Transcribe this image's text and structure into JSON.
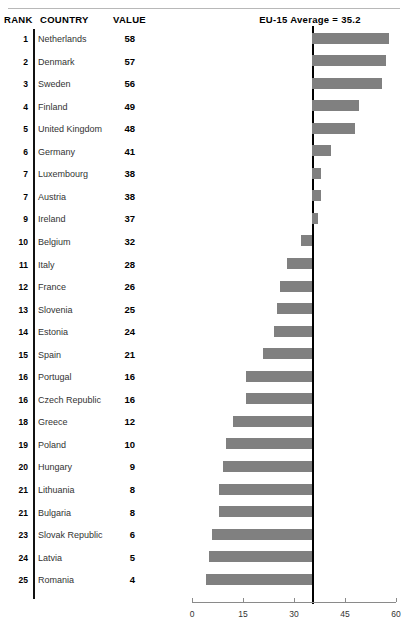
{
  "table": {
    "headers": {
      "rank": "RANK",
      "country": "COUNTRY",
      "value": "VALUE"
    },
    "rows": [
      {
        "rank": "1",
        "country": "Netherlands",
        "value": "58"
      },
      {
        "rank": "2",
        "country": "Denmark",
        "value": "57"
      },
      {
        "rank": "3",
        "country": "Sweden",
        "value": "56"
      },
      {
        "rank": "4",
        "country": "Finland",
        "value": "49"
      },
      {
        "rank": "5",
        "country": "United Kingdom",
        "value": "48"
      },
      {
        "rank": "6",
        "country": "Germany",
        "value": "41"
      },
      {
        "rank": "7",
        "country": "Luxembourg",
        "value": "38"
      },
      {
        "rank": "7",
        "country": "Austria",
        "value": "38"
      },
      {
        "rank": "9",
        "country": "Ireland",
        "value": "37"
      },
      {
        "rank": "10",
        "country": "Belgium",
        "value": "32"
      },
      {
        "rank": "11",
        "country": "Italy",
        "value": "28"
      },
      {
        "rank": "12",
        "country": "France",
        "value": "26"
      },
      {
        "rank": "13",
        "country": "Slovenia",
        "value": "25"
      },
      {
        "rank": "14",
        "country": "Estonia",
        "value": "24"
      },
      {
        "rank": "15",
        "country": "Spain",
        "value": "21"
      },
      {
        "rank": "16",
        "country": "Portugal",
        "value": "16"
      },
      {
        "rank": "16",
        "country": "Czech Republic",
        "value": "16"
      },
      {
        "rank": "18",
        "country": "Greece",
        "value": "12"
      },
      {
        "rank": "19",
        "country": "Poland",
        "value": "10"
      },
      {
        "rank": "20",
        "country": "Hungary",
        "value": "9"
      },
      {
        "rank": "21",
        "country": "Lithuania",
        "value": "8"
      },
      {
        "rank": "21",
        "country": "Bulgaria",
        "value": "8"
      },
      {
        "rank": "23",
        "country": "Slovak Republic",
        "value": "6"
      },
      {
        "rank": "24",
        "country": "Latvia",
        "value": "5"
      },
      {
        "rank": "25",
        "country": "Romania",
        "value": "4"
      }
    ]
  },
  "chart_data": {
    "type": "bar",
    "orientation": "horizontal",
    "title": "EU-15 Average = 35.2",
    "xlabel": "",
    "ylabel": "",
    "xlim": [
      0,
      60
    ],
    "xticks": [
      0,
      15,
      30,
      45,
      60
    ],
    "xtick_labels": [
      "0",
      "15",
      "30",
      "45",
      "60"
    ],
    "grid": false,
    "legend": "none",
    "reference_line": {
      "label": "EU-15 Average = 35.2",
      "value": 35.2,
      "color": "#000000"
    },
    "bar_color": "#808080",
    "categories": [
      "Netherlands",
      "Denmark",
      "Sweden",
      "Finland",
      "United Kingdom",
      "Germany",
      "Luxembourg",
      "Austria",
      "Ireland",
      "Belgium",
      "Italy",
      "France",
      "Slovenia",
      "Estonia",
      "Spain",
      "Portugal",
      "Czech Republic",
      "Greece",
      "Poland",
      "Hungary",
      "Lithuania",
      "Bulgaria",
      "Slovak Republic",
      "Latvia",
      "Romania"
    ],
    "values": [
      58,
      57,
      56,
      49,
      48,
      41,
      38,
      38,
      37,
      32,
      28,
      26,
      25,
      24,
      21,
      16,
      16,
      12,
      10,
      9,
      8,
      8,
      6,
      5,
      4
    ]
  }
}
